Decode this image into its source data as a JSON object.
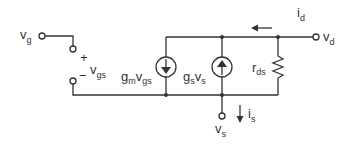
{
  "diagram": {
    "type": "small-signal-equivalent-circuit",
    "colors": {
      "line": "#333333",
      "background": "#ffffff"
    },
    "terminals": {
      "gate": {
        "main": "v",
        "sub": "g"
      },
      "drain": {
        "main": "v",
        "sub": "d"
      },
      "source": {
        "main": "v",
        "sub": "s"
      }
    },
    "port_voltage": {
      "plus": "+",
      "minus": "−",
      "main": "v",
      "sub": "gs"
    },
    "sources": {
      "gm": {
        "p1": "g",
        "s1": "m",
        "p2": "v",
        "s2": "gs",
        "direction": "down"
      },
      "gs": {
        "p1": "g",
        "s1": "s",
        "p2": "v",
        "s2": "s",
        "direction": "up"
      }
    },
    "resistor": {
      "main": "r",
      "sub": "ds"
    },
    "currents": {
      "drain": {
        "main": "i",
        "sub": "d",
        "direction": "left"
      },
      "source": {
        "main": "i",
        "sub": "s",
        "direction": "down"
      }
    }
  }
}
